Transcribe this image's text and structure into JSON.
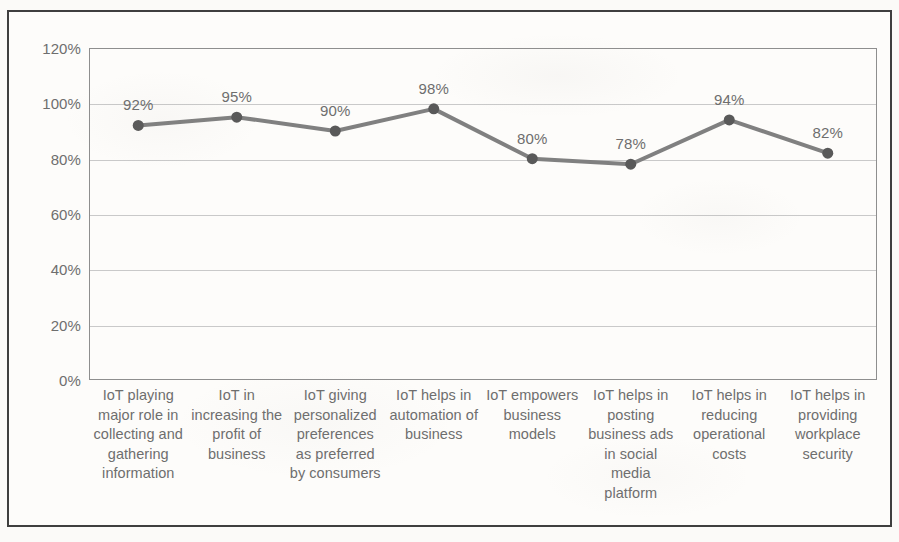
{
  "chart_data": {
    "type": "line",
    "title": "",
    "subtitle": "",
    "xlabel": "",
    "ylabel": "",
    "ylim": [
      0,
      120
    ],
    "y_ticks": [
      "0%",
      "20%",
      "40%",
      "60%",
      "80%",
      "100%",
      "120%"
    ],
    "y_tick_values": [
      0,
      20,
      40,
      60,
      80,
      100,
      120
    ],
    "grid": true,
    "legend": "none",
    "categories": [
      "IoT playing major role in collecting and gathering information",
      "IoT in increasing the profit of business",
      "IoT giving personalized preferences as preferred by consumers",
      "IoT helps in automation of business",
      "IoT empowers business models",
      "IoT helps in posting business ads in social media platform",
      "IoT helps in reducing operational costs",
      "IoT helps in providing workplace security"
    ],
    "values": [
      92,
      95,
      90,
      98,
      80,
      78,
      94,
      82
    ],
    "data_labels": [
      "92%",
      "95%",
      "90%",
      "98%",
      "80%",
      "78%",
      "94%",
      "82%"
    ],
    "series_name": "",
    "line_color": "#808080",
    "marker_color": "#595959",
    "text_color": "#6e6e6e",
    "gridline_color": "#c9c9c9",
    "plot_border_color": "#8e8e8e",
    "frame_border_color": "#3f3f3f"
  }
}
